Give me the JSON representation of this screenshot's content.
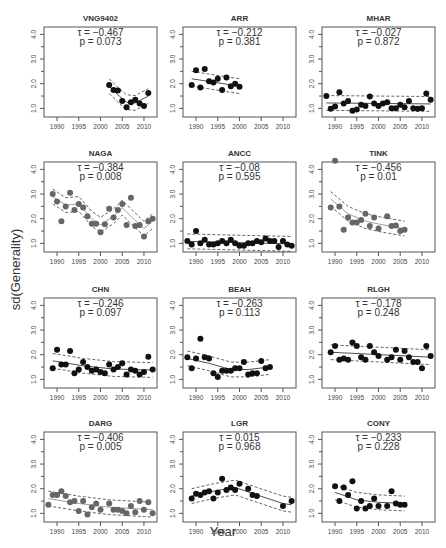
{
  "chart_data": {
    "type": "scatter",
    "ylabel": "sd(Generality)",
    "xlabel": "Year",
    "xlim": [
      1987,
      2013
    ],
    "ylim": [
      0.65,
      4.3
    ],
    "xticks": [
      1990,
      1995,
      2000,
      2005,
      2010
    ],
    "yticks": [
      1.0,
      2.0,
      3.0,
      4.0
    ],
    "ytick_labels": [
      "1.0",
      "2.0",
      "3.0",
      "4.0"
    ],
    "panels": [
      {
        "title": "VNG9402",
        "tau": "τ = −0.467",
        "p": "p =   0.073",
        "color": "#111111",
        "x": [
          2002,
          2003,
          2004,
          2005,
          2006,
          2007,
          2008,
          2009,
          2010,
          2011
        ],
        "y": [
          1.95,
          1.75,
          1.72,
          1.3,
          1.05,
          1.25,
          1.35,
          1.2,
          1.1,
          1.62
        ],
        "fit": [
          [
            2002,
            1.9
          ],
          [
            2004,
            1.55
          ],
          [
            2006,
            1.25
          ],
          [
            2008,
            1.22
          ],
          [
            2011,
            1.5
          ]
        ]
      },
      {
        "title": "ARR",
        "tau": "τ = −0.212",
        "p": "p =   0.381",
        "color": "#111111",
        "x": [
          1989,
          1990,
          1991,
          1992,
          1993,
          1994,
          1995,
          1996,
          1997,
          1998,
          1999,
          2000
        ],
        "y": [
          1.95,
          2.55,
          1.85,
          2.6,
          2.1,
          2.05,
          2.2,
          1.75,
          2.25,
          1.9,
          2.0,
          1.88
        ],
        "fit": [
          [
            1989,
            2.2
          ],
          [
            2000,
            1.9
          ]
        ]
      },
      {
        "title": "MHAR",
        "tau": "τ = −0.027",
        "p": "p =   0.872",
        "color": "#111111",
        "x": [
          1988,
          1989,
          1990,
          1991,
          1992,
          1993,
          1994,
          1995,
          1996,
          1997,
          1998,
          1999,
          2000,
          2001,
          2002,
          2003,
          2004,
          2005,
          2006,
          2007,
          2008,
          2009,
          2010,
          2011,
          2012
        ],
        "y": [
          1.5,
          0.98,
          1.08,
          1.65,
          1.2,
          1.3,
          0.9,
          0.95,
          1.15,
          1.1,
          1.48,
          1.2,
          1.1,
          1.2,
          1.25,
          1.0,
          1.0,
          1.15,
          1.05,
          1.3,
          1.0,
          0.98,
          1.0,
          1.6,
          1.35
        ],
        "fit": [
          [
            1988,
            1.22
          ],
          [
            2012,
            1.18
          ]
        ]
      },
      {
        "title": "NAGA",
        "tau": "τ = −0.384",
        "p": "p =   0.008",
        "color": "#666666",
        "x": [
          1989,
          1990,
          1991,
          1992,
          1993,
          1994,
          1995,
          1996,
          1997,
          1998,
          1999,
          2000,
          2001,
          2002,
          2003,
          2004,
          2005,
          2006,
          2007,
          2008,
          2009,
          2010,
          2011,
          2012
        ],
        "y": [
          3.0,
          2.7,
          1.9,
          2.5,
          3.05,
          2.35,
          2.6,
          2.45,
          2.1,
          1.8,
          1.8,
          1.45,
          1.78,
          2.4,
          2.05,
          2.35,
          2.6,
          1.75,
          2.85,
          1.7,
          1.75,
          1.28,
          1.9,
          2.0
        ],
        "fit": [
          [
            1989,
            2.9
          ],
          [
            1992,
            2.55
          ],
          [
            1995,
            2.6
          ],
          [
            1998,
            2.0
          ],
          [
            2000,
            1.75
          ],
          [
            2003,
            2.1
          ],
          [
            2005,
            2.45
          ],
          [
            2007,
            2.1
          ],
          [
            2010,
            1.6
          ],
          [
            2012,
            1.9
          ]
        ]
      },
      {
        "title": "ANCC",
        "tau": "τ = −0.08",
        "p": "p =   0.595",
        "color": "#111111",
        "x": [
          1988,
          1989,
          1990,
          1991,
          1992,
          1993,
          1994,
          1995,
          1996,
          1997,
          1998,
          1999,
          2000,
          2001,
          2002,
          2003,
          2004,
          2005,
          2006,
          2007,
          2008,
          2009,
          2010,
          2011,
          2012
        ],
        "y": [
          1.1,
          0.95,
          1.5,
          1.0,
          1.15,
          0.95,
          0.95,
          1.0,
          1.1,
          1.0,
          1.15,
          1.0,
          0.9,
          0.9,
          1.0,
          1.0,
          1.1,
          1.05,
          1.2,
          1.1,
          1.1,
          0.85,
          1.1,
          0.95,
          0.9
        ],
        "fit": [
          [
            1988,
            1.08
          ],
          [
            2012,
            0.98
          ]
        ]
      },
      {
        "title": "TINK",
        "tau": "τ = −0.456",
        "p": "p =   0.01",
        "color": "#666666",
        "x": [
          1989,
          1990,
          1991,
          1992,
          1993,
          1994,
          1995,
          1996,
          1997,
          1998,
          1999,
          2000,
          2002,
          2003,
          2004,
          2005,
          2006
        ],
        "y": [
          2.45,
          4.35,
          2.5,
          1.55,
          2.05,
          1.85,
          1.85,
          1.95,
          2.2,
          1.7,
          2.05,
          1.6,
          2.1,
          1.7,
          1.72,
          1.5,
          1.55
        ],
        "fit": [
          [
            1989,
            2.8
          ],
          [
            1993,
            2.2
          ],
          [
            1997,
            1.9
          ],
          [
            2001,
            1.75
          ],
          [
            2006,
            1.6
          ]
        ]
      },
      {
        "title": "CHN",
        "tau": "τ = −0.246",
        "p": "p =   0.097",
        "color": "#111111",
        "x": [
          1989,
          1990,
          1991,
          1992,
          1993,
          1994,
          1995,
          1996,
          1997,
          1998,
          1999,
          2000,
          2001,
          2002,
          2003,
          2004,
          2005,
          2006,
          2007,
          2008,
          2009,
          2010,
          2011,
          2012
        ],
        "y": [
          1.45,
          2.2,
          1.6,
          1.6,
          2.15,
          1.25,
          1.4,
          1.7,
          1.5,
          1.35,
          1.4,
          1.3,
          1.25,
          1.6,
          1.4,
          1.5,
          1.65,
          1.2,
          1.4,
          1.35,
          1.2,
          1.3,
          1.92,
          1.4
        ],
        "fit": [
          [
            1989,
            1.75
          ],
          [
            1996,
            1.55
          ],
          [
            2003,
            1.42
          ],
          [
            2012,
            1.38
          ]
        ]
      },
      {
        "title": "BEAH",
        "tau": "τ = −0.263",
        "p": "p =   0.113",
        "color": "#111111",
        "x": [
          1988,
          1989,
          1990,
          1991,
          1992,
          1993,
          1994,
          1995,
          1996,
          1997,
          1998,
          1999,
          2000,
          2001,
          2002,
          2003,
          2004,
          2005,
          2006,
          2007
        ],
        "y": [
          1.9,
          1.45,
          1.85,
          2.65,
          1.9,
          1.85,
          1.25,
          1.1,
          1.35,
          1.35,
          1.35,
          1.45,
          1.45,
          1.7,
          1.2,
          1.25,
          1.25,
          1.75,
          1.45,
          1.5
        ],
        "fit": [
          [
            1988,
            1.85
          ],
          [
            1993,
            1.65
          ],
          [
            1998,
            1.4
          ],
          [
            2002,
            1.4
          ],
          [
            2007,
            1.5
          ]
        ]
      },
      {
        "title": "RLGH",
        "tau": "τ = −0.178",
        "p": "p =   0.248",
        "color": "#111111",
        "x": [
          1989,
          1990,
          1991,
          1992,
          1993,
          1994,
          1995,
          1996,
          1997,
          1998,
          1999,
          2000,
          2002,
          2003,
          2004,
          2005,
          2006,
          2007,
          2008,
          2009,
          2010,
          2011,
          2012
        ],
        "y": [
          2.1,
          2.35,
          1.8,
          1.85,
          1.8,
          2.5,
          2.35,
          1.9,
          1.8,
          2.35,
          2.1,
          1.95,
          1.8,
          1.9,
          2.2,
          1.8,
          2.15,
          1.9,
          1.7,
          1.7,
          1.45,
          2.35,
          1.95
        ],
        "fit": [
          [
            1989,
            2.1
          ],
          [
            2012,
            1.9
          ]
        ]
      },
      {
        "title": "DARG",
        "tau": "τ = −0.406",
        "p": "p =   0.005",
        "color": "#666666",
        "x": [
          1988,
          1989,
          1990,
          1991,
          1992,
          1993,
          1994,
          1995,
          1996,
          1997,
          1998,
          1999,
          2000,
          2002,
          2003,
          2004,
          2005,
          2006,
          2007,
          2008,
          2009,
          2010,
          2011,
          2012
        ],
        "y": [
          1.35,
          1.75,
          1.75,
          1.9,
          1.7,
          1.45,
          1.5,
          1.1,
          1.5,
          0.95,
          1.25,
          1.4,
          1.15,
          1.4,
          1.15,
          1.15,
          1.1,
          1.0,
          1.3,
          1.05,
          1.5,
          1.15,
          1.45,
          1.0
        ],
        "fit": [
          [
            1988,
            1.6
          ],
          [
            1995,
            1.4
          ],
          [
            2002,
            1.25
          ],
          [
            2012,
            1.15
          ]
        ]
      },
      {
        "title": "LGR",
        "tau": "τ = 0.015",
        "p": "p =   0.968",
        "color": "#111111",
        "x": [
          1989,
          1990,
          1991,
          1992,
          1993,
          1994,
          1995,
          1996,
          1997,
          1998,
          1999,
          2000,
          2002,
          2003,
          2004,
          2010,
          2012
        ],
        "y": [
          1.6,
          1.8,
          1.75,
          1.85,
          1.9,
          1.6,
          1.85,
          2.4,
          1.95,
          2.05,
          1.95,
          2.2,
          2.0,
          1.75,
          1.7,
          1.3,
          1.5
        ],
        "fit": [
          [
            1989,
            1.7
          ],
          [
            1994,
            1.9
          ],
          [
            1999,
            2.05
          ],
          [
            2004,
            1.75
          ],
          [
            2010,
            1.4
          ],
          [
            2012,
            1.35
          ]
        ]
      },
      {
        "title": "CONY",
        "tau": "τ = −0.233",
        "p": "p =   0.228",
        "color": "#111111",
        "x": [
          1990,
          1991,
          1992,
          1993,
          1994,
          1995,
          1996,
          1997,
          1998,
          1999,
          2000,
          2002,
          2003,
          2004,
          2005,
          2006
        ],
        "y": [
          2.1,
          1.5,
          2.05,
          1.75,
          2.3,
          1.2,
          1.5,
          1.2,
          1.3,
          1.6,
          1.3,
          1.3,
          1.9,
          1.4,
          1.35,
          1.35
        ],
        "fit": [
          [
            1990,
            1.85
          ],
          [
            1995,
            1.55
          ],
          [
            2000,
            1.45
          ],
          [
            2006,
            1.4
          ]
        ]
      }
    ]
  }
}
